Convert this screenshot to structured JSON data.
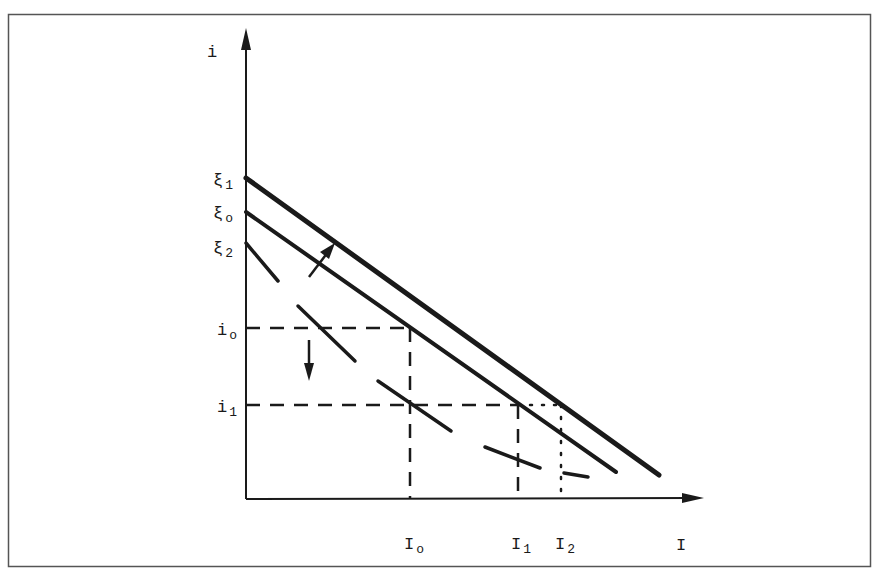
{
  "diagram": {
    "type": "economics-graph",
    "y_axis_label": "i",
    "x_axis_label": "I",
    "lines": [
      {
        "id": "xi1",
        "label": "ξ",
        "sub": "1",
        "style": "solid",
        "description": "upper shifted investment schedule"
      },
      {
        "id": "xi0",
        "label": "ξ",
        "sub": "o",
        "style": "solid",
        "description": "original investment schedule"
      },
      {
        "id": "xi2",
        "label": "ξ",
        "sub": "2",
        "style": "dashed",
        "description": "lower shifted investment schedule"
      }
    ],
    "y_ticks": [
      {
        "id": "i0",
        "label": "i",
        "sub": "o"
      },
      {
        "id": "i1",
        "label": "i",
        "sub": "1"
      }
    ],
    "x_ticks": [
      {
        "id": "I0",
        "label": "I",
        "sub": "o"
      },
      {
        "id": "I1",
        "label": "I",
        "sub": "1"
      },
      {
        "id": "I2",
        "label": "I",
        "sub": "2"
      }
    ],
    "arrows": [
      {
        "id": "shift-up",
        "direction": "up-right",
        "meaning": "shift from xi0 to xi1"
      },
      {
        "id": "rate-down",
        "direction": "down",
        "meaning": "interest rate falls from i0 to i1"
      }
    ],
    "colors": {
      "ink": "#1a1a1a",
      "frame": "#555555",
      "background": "#ffffff"
    }
  }
}
